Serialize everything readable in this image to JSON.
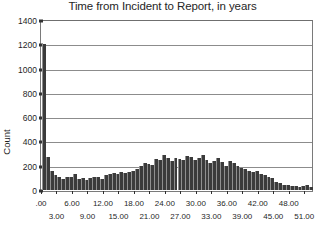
{
  "chart_data": {
    "type": "bar",
    "title": "Time from Incident to Report, in years",
    "xlabel": "",
    "ylabel": "Count",
    "ylim": [
      0,
      1400
    ],
    "ytick_values": [
      0,
      200,
      400,
      600,
      800,
      1000,
      1200,
      1400
    ],
    "ytick_labels": [
      "0",
      "200",
      "400",
      "600",
      "800",
      "1000",
      "1200",
      "1400"
    ],
    "grid": true,
    "legend": false,
    "xlim": [
      0,
      52.5
    ],
    "bin_width": 0.75,
    "xtick_labels_row1": [
      ".00",
      "6.00",
      "12.00",
      "18.00",
      "24.00",
      "30.00",
      "36.00",
      "42.00",
      "48.00"
    ],
    "xtick_values_row1": [
      0,
      6,
      12,
      18,
      24,
      30,
      36,
      42,
      48
    ],
    "xtick_labels_row2": [
      "3.00",
      "9.00",
      "15.00",
      "21.00",
      "27.00",
      "33.00",
      "39.00",
      "45.00",
      "51.00"
    ],
    "xtick_values_row2": [
      3,
      9,
      15,
      21,
      27,
      33,
      39,
      45,
      51
    ],
    "x": [
      0.375,
      1.125,
      1.875,
      2.625,
      3.375,
      4.125,
      4.875,
      5.625,
      6.375,
      7.125,
      7.875,
      8.625,
      9.375,
      10.125,
      10.875,
      11.625,
      12.375,
      13.125,
      13.875,
      14.625,
      15.375,
      16.125,
      16.875,
      17.625,
      18.375,
      19.125,
      19.875,
      20.625,
      21.375,
      22.125,
      22.875,
      23.625,
      24.375,
      25.125,
      25.875,
      26.625,
      27.375,
      28.125,
      28.875,
      29.625,
      30.375,
      31.125,
      31.875,
      32.625,
      33.375,
      34.125,
      34.875,
      35.625,
      36.375,
      37.125,
      37.875,
      38.625,
      39.375,
      40.125,
      40.875,
      41.625,
      42.375,
      43.125,
      43.875,
      44.625,
      45.375,
      46.125,
      46.875,
      47.625,
      48.375,
      49.125,
      49.875,
      50.625,
      51.375,
      52.125
    ],
    "values": [
      1200,
      270,
      155,
      120,
      105,
      90,
      110,
      105,
      130,
      90,
      100,
      85,
      95,
      105,
      110,
      90,
      120,
      130,
      140,
      135,
      145,
      140,
      150,
      155,
      175,
      200,
      225,
      215,
      210,
      255,
      245,
      290,
      260,
      235,
      265,
      255,
      245,
      280,
      270,
      250,
      265,
      290,
      250,
      225,
      235,
      265,
      230,
      200,
      235,
      225,
      195,
      180,
      175,
      155,
      150,
      160,
      130,
      125,
      110,
      95,
      70,
      55,
      40,
      40,
      35,
      30,
      25,
      30,
      45,
      25
    ]
  }
}
